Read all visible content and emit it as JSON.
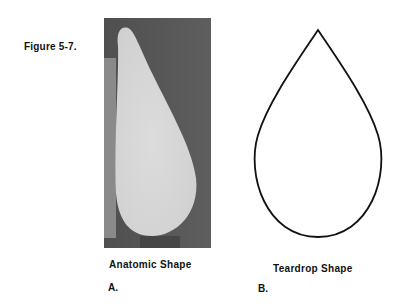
{
  "figure": {
    "label": "Figure 5-7."
  },
  "panels": [
    {
      "id": "A",
      "caption": "Anatomic Shape",
      "letter": "A.",
      "content": "photograph of anatomic breast implant, side view",
      "colors": {
        "background": "#5a5a5a",
        "left_strip": "#8a8a8a",
        "implant": "#d6d6d6"
      }
    },
    {
      "id": "B",
      "caption": "Teardrop Shape",
      "letter": "B.",
      "content": "line drawing of teardrop outline",
      "colors": {
        "stroke": "#111111",
        "fill": "#ffffff"
      }
    }
  ]
}
